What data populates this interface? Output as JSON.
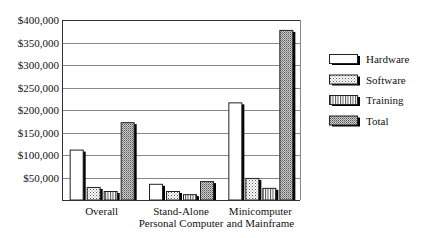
{
  "chart_data": {
    "type": "bar",
    "title": "",
    "xlabel": "",
    "ylabel": "",
    "categories": [
      "Overall",
      "Stand-Alone\nPersonal Computer",
      "Minicomputer\nand Mainframe"
    ],
    "category_lines": [
      [
        "Overall"
      ],
      [
        "Stand-Alone",
        "Personal Computer"
      ],
      [
        "Minicomputer",
        "and Mainframe"
      ]
    ],
    "series": [
      {
        "name": "Hardware",
        "pattern": "white",
        "values": [
          112000,
          36000,
          217000
        ]
      },
      {
        "name": "Software",
        "pattern": "dots",
        "values": [
          29000,
          20000,
          49000
        ]
      },
      {
        "name": "Training",
        "pattern": "vertical-lines",
        "values": [
          20000,
          13000,
          27000
        ]
      },
      {
        "name": "Total",
        "pattern": "dense-dots",
        "values": [
          173000,
          42000,
          378000
        ]
      }
    ],
    "ylim": [
      0,
      400000
    ],
    "yticks": [
      50000,
      100000,
      150000,
      200000,
      250000,
      300000,
      350000,
      400000
    ],
    "ytick_labels": [
      "$50,000",
      "$100,000",
      "$150,000",
      "$200,000",
      "$250,000",
      "$300,000",
      "$350,000",
      "$400,000"
    ],
    "grid": true,
    "legend_position": "right",
    "colors": {
      "fill": "#ffffff",
      "pattern": "#555555",
      "shadow": "#000000",
      "grid": "#888888",
      "axis": "#333333"
    }
  }
}
